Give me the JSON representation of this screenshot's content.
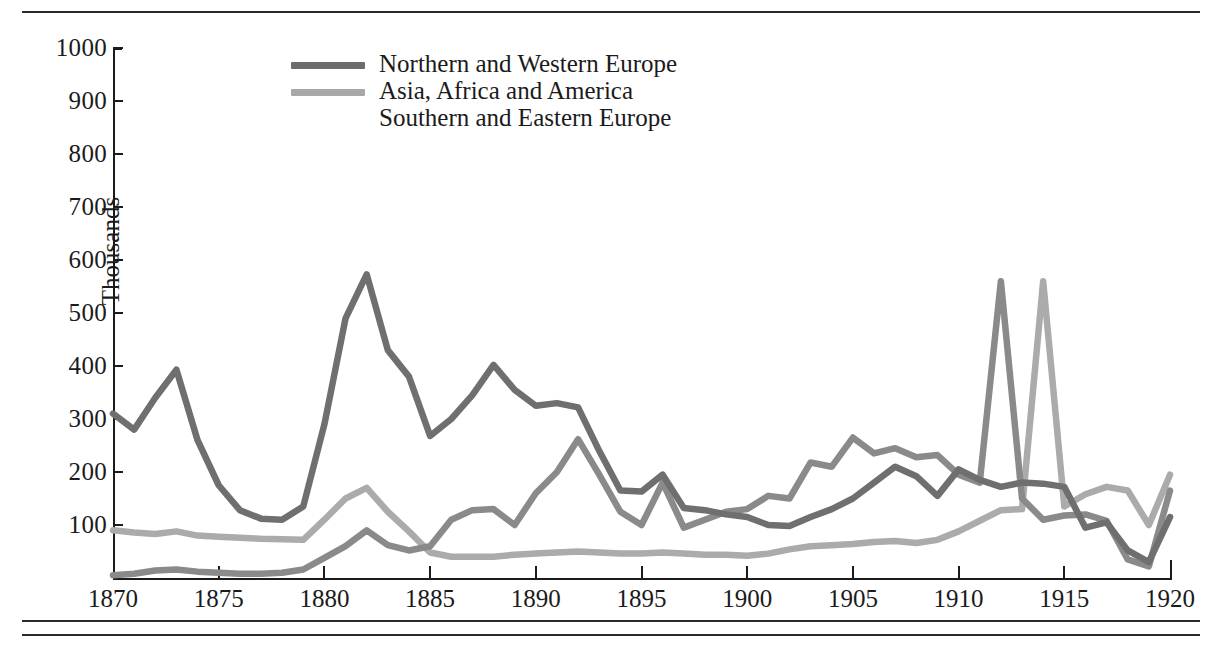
{
  "figure": {
    "name": "immigration-by-origin-line-chart"
  },
  "axes": {
    "y_title": "Thousands",
    "y_ticks": [
      100,
      200,
      300,
      400,
      500,
      600,
      700,
      800,
      900,
      1000
    ],
    "x_ticks": [
      1870,
      1875,
      1880,
      1885,
      1890,
      1895,
      1900,
      1905,
      1910,
      1915,
      1920
    ]
  },
  "legend": {
    "items": [
      {
        "label": "Northern and Western Europe",
        "color": "#6b6b6b",
        "swatch": true
      },
      {
        "label": "Asia, Africa and America",
        "color": "#a8a8a8",
        "swatch": true
      },
      {
        "label": "Southern and Eastern Europe",
        "color": "#7d7d7d",
        "swatch": false
      }
    ]
  },
  "colors": {
    "series_northern_western": "#6f6f6f",
    "series_asia_africa_america": "#ababab",
    "series_southern_eastern": "#8a8a8a",
    "axis": "#1b1b1b",
    "rule": "#2a2a2a",
    "background": "#ffffff"
  },
  "chart_data": {
    "type": "line",
    "title": "",
    "xlabel": "",
    "ylabel": "Thousands",
    "xlim": [
      1870,
      1920
    ],
    "ylim": [
      0,
      1000
    ],
    "grid": false,
    "legend_position": "top-center",
    "x": [
      1870,
      1871,
      1872,
      1873,
      1874,
      1875,
      1876,
      1877,
      1878,
      1879,
      1880,
      1881,
      1882,
      1883,
      1884,
      1885,
      1886,
      1887,
      1888,
      1889,
      1890,
      1891,
      1892,
      1893,
      1894,
      1895,
      1896,
      1897,
      1898,
      1899,
      1900,
      1901,
      1902,
      1903,
      1904,
      1905,
      1906,
      1907,
      1908,
      1909,
      1910,
      1911,
      1912,
      1913,
      1914,
      1915,
      1916,
      1917,
      1918,
      1919,
      1920
    ],
    "series": [
      {
        "name": "Northern and Western Europe",
        "color": "#6f6f6f",
        "values": [
          310,
          280,
          340,
          393,
          260,
          175,
          128,
          112,
          110,
          135,
          290,
          490,
          573,
          430,
          380,
          268,
          300,
          345,
          402,
          355,
          325,
          330,
          322,
          240,
          165,
          163,
          195,
          132,
          128,
          120,
          115,
          100,
          98,
          115,
          130,
          150,
          180,
          210,
          192,
          155,
          205,
          185,
          172,
          180,
          178,
          172,
          95,
          105,
          52,
          30,
          115
        ]
      },
      {
        "name": "Asia, Africa and America",
        "color": "#ababab",
        "values": [
          90,
          86,
          83,
          88,
          80,
          78,
          76,
          74,
          73,
          72,
          110,
          150,
          170,
          125,
          88,
          48,
          40,
          40,
          40,
          44,
          46,
          48,
          50,
          48,
          46,
          46,
          48,
          46,
          44,
          44,
          42,
          46,
          54,
          60,
          62,
          64,
          68,
          70,
          66,
          72,
          88,
          108,
          128,
          130,
          560,
          135,
          158,
          172,
          165,
          100,
          195
        ]
      },
      {
        "name": "Southern and Eastern Europe",
        "color": "#8a8a8a",
        "values": [
          5,
          8,
          14,
          16,
          12,
          10,
          8,
          8,
          10,
          16,
          38,
          60,
          90,
          62,
          52,
          60,
          110,
          128,
          130,
          100,
          160,
          200,
          262,
          195,
          125,
          100,
          180,
          95,
          110,
          125,
          130,
          155,
          150,
          218,
          210,
          265,
          235,
          245,
          228,
          232,
          195,
          180,
          560,
          150,
          110,
          118,
          120,
          108,
          35,
          22,
          165
        ]
      }
    ],
    "notes": [
      "Three-series time-series of immigration to the United States, 1870-1920.",
      "Northern and Western Europe declines after the 1882 peak of ~573 thousand.",
      "Southern and Eastern Europe peaks at ~955 thousand in 1907 and ~880 thousand in 1913.",
      "All series collapse during World War I (1915-1919)."
    ]
  }
}
